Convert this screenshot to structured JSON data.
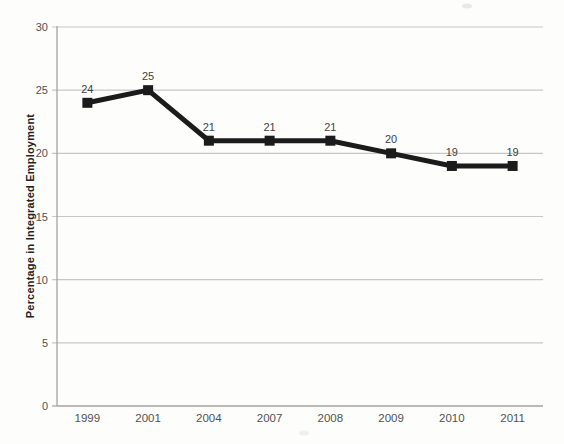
{
  "page": {
    "background": "#fdfdfc"
  },
  "chart_data": {
    "type": "line",
    "title": "",
    "categories": [
      "1999",
      "2001",
      "2004",
      "2007",
      "2008",
      "2009",
      "2010",
      "2011"
    ],
    "series": [
      {
        "name": "Percentage in Integrated Employment",
        "values": [
          24,
          25,
          21,
          21,
          21,
          20,
          19,
          19
        ]
      }
    ],
    "point_labels": [
      "24",
      "25",
      "21",
      "21",
      "21",
      "20",
      "19",
      "19"
    ],
    "xlabel": "",
    "ylabel": "Percentage in Integrated Employment",
    "ylim": [
      0,
      30
    ],
    "yticks": [
      0,
      5,
      10,
      15,
      20,
      25,
      30
    ],
    "grid": "horizontal",
    "legend": "none",
    "style": {
      "line_color": "#1b1b1b",
      "line_width": 5,
      "marker": "square",
      "marker_size": 10,
      "grid_color": "#c7c7c7",
      "axis_color": "#a3a3a3",
      "tick_label_color": "#525252",
      "point_label_color": "#424242",
      "ylabel_color": "#232323",
      "tick_font_size": 11,
      "point_label_font_size": 11,
      "ylabel_font_size": 11
    }
  }
}
